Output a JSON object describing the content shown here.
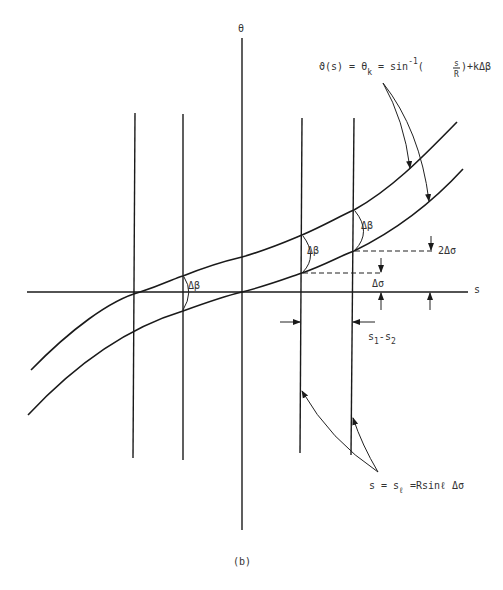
{
  "figure": {
    "caption": "(b)",
    "axes": {
      "vertical_label": "θ",
      "horizontal_label": "s"
    },
    "equation_top": {
      "lhs": "ϑ(s) = θ",
      "lhs_sub": "k",
      "mid": " = sin",
      "sup": "-1",
      "frac_open": "(",
      "frac_num": "s",
      "frac_den": "R",
      "tail": ")+kΔβ"
    },
    "angle_labels": [
      "Δβ",
      "Δβ",
      "Δβ"
    ],
    "offset_labels": {
      "one": "Δσ",
      "two": "2Δσ"
    },
    "spacing_label": {
      "s1": "s",
      "s1_sub": "1",
      "dash": "-s",
      "s2_sub": "2"
    },
    "equation_bottom": {
      "lhs": "s = s",
      "sub": "ℓ",
      "rhs": " =Rsinℓ Δσ"
    }
  }
}
